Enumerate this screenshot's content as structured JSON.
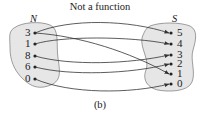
{
  "title": "Not a function",
  "caption": "(b)",
  "sets": {
    "domain": {
      "name": "N",
      "elements": [
        "3",
        "1",
        "8",
        "6",
        "0"
      ]
    },
    "codomain": {
      "name": "S",
      "elements": [
        "5",
        "4",
        "3",
        "2",
        "1",
        "0"
      ]
    }
  },
  "mappings": [
    {
      "from": "3",
      "to": "5"
    },
    {
      "from": "3",
      "to": "1"
    },
    {
      "from": "1",
      "to": "4"
    },
    {
      "from": "8",
      "to": "3"
    },
    {
      "from": "6",
      "to": "2"
    },
    {
      "from": "0",
      "to": "0"
    }
  ],
  "colors": {
    "set_fill": "#e6e6e6",
    "stroke": "#333333"
  }
}
